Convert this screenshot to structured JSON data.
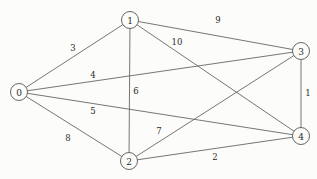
{
  "figure": {
    "background_color": "#fcfcfa",
    "edge_color": "#666666",
    "node_stroke_color": "#555555",
    "node_fill_color": "#fcfcfa",
    "label_color": "#2b2b2b"
  },
  "chart_data": {
    "type": "diagram",
    "diagram_kind": "weighted-undirected-graph",
    "title": "",
    "xlabel": "",
    "ylabel": "",
    "node_radius": 8.5,
    "nodes": [
      {
        "id": "0",
        "label": "0",
        "x": 19,
        "y": 92
      },
      {
        "id": "1",
        "label": "1",
        "x": 130,
        "y": 20
      },
      {
        "id": "2",
        "label": "2",
        "x": 129,
        "y": 161
      },
      {
        "id": "3",
        "label": "3",
        "x": 301,
        "y": 51
      },
      {
        "id": "4",
        "label": "4",
        "x": 301,
        "y": 136
      }
    ],
    "edges": [
      {
        "source": "0",
        "target": "1",
        "weight": "3",
        "label_x": 73,
        "label_y": 48
      },
      {
        "source": "0",
        "target": "3",
        "weight": "4",
        "label_x": 93,
        "label_y": 75
      },
      {
        "source": "0",
        "target": "4",
        "weight": "5",
        "label_x": 93,
        "label_y": 111
      },
      {
        "source": "0",
        "target": "2",
        "weight": "8",
        "label_x": 68,
        "label_y": 138
      },
      {
        "source": "1",
        "target": "2",
        "weight": "6",
        "label_x": 136,
        "label_y": 91
      },
      {
        "source": "1",
        "target": "4",
        "weight": "10",
        "label_x": 177,
        "label_y": 42
      },
      {
        "source": "1",
        "target": "3",
        "weight": "9",
        "label_x": 218,
        "label_y": 20
      },
      {
        "source": "3",
        "target": "4",
        "weight": "1",
        "label_x": 308,
        "label_y": 93
      },
      {
        "source": "2",
        "target": "3",
        "weight": "7",
        "label_x": 159,
        "label_y": 131
      },
      {
        "source": "2",
        "target": "4",
        "weight": "2",
        "label_x": 215,
        "label_y": 157
      }
    ],
    "node_count": 5,
    "edge_count": 10
  }
}
